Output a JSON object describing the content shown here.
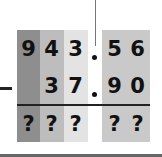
{
  "problem": {
    "operation": "subtraction",
    "operator": "−",
    "minuend": {
      "int": [
        "9",
        "4",
        "3"
      ],
      "frac": [
        "5",
        "6"
      ],
      "text": "943.56"
    },
    "subtrahend": {
      "int": [
        "",
        "3",
        "7"
      ],
      "frac": [
        "9",
        "0"
      ],
      "text": "37.90"
    },
    "result": {
      "int": [
        "?",
        "?",
        "?"
      ],
      "frac": [
        "?",
        "?"
      ]
    }
  },
  "colors": {
    "col_hundreds": "#8e8e8e",
    "col_tens": "#bdbdbd",
    "col_ones": "#e3e3e3",
    "col_decimals": "#c9c9c9",
    "line": "#222222",
    "bottom_bar": "#666666"
  }
}
